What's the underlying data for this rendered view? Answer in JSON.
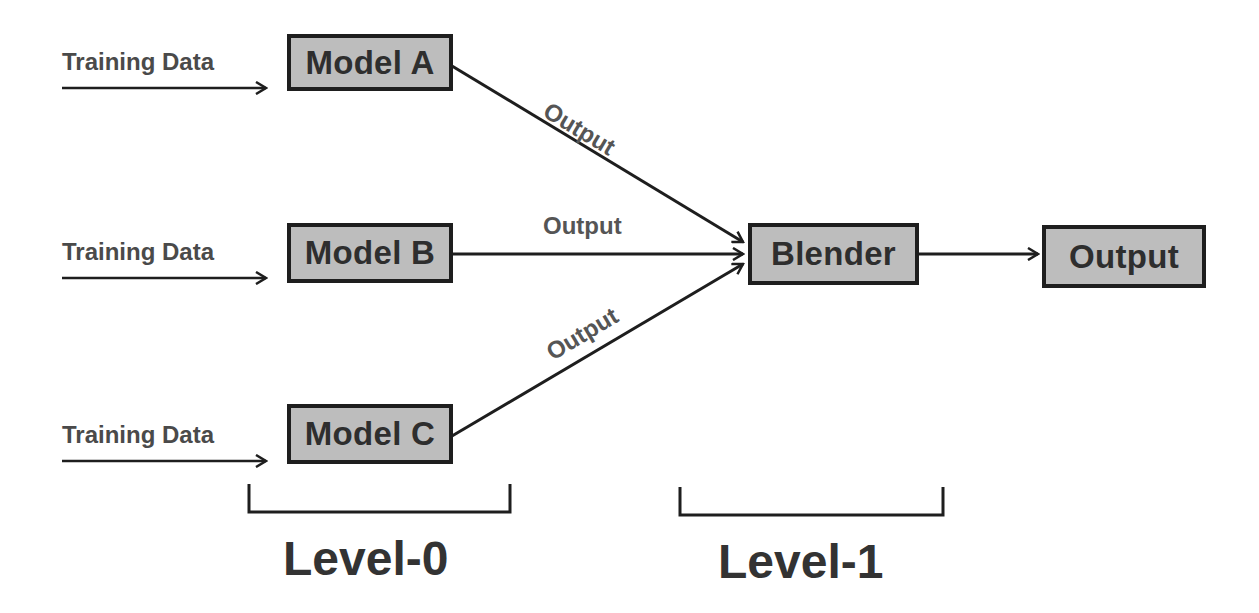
{
  "diagram": {
    "inputs": [
      {
        "label": "Training Data"
      },
      {
        "label": "Training Data"
      },
      {
        "label": "Training Data"
      }
    ],
    "models": [
      {
        "label": "Model A"
      },
      {
        "label": "Model B"
      },
      {
        "label": "Model C"
      }
    ],
    "edge_labels": [
      {
        "label": "Output"
      },
      {
        "label": "Output"
      },
      {
        "label": "Output"
      }
    ],
    "blender": {
      "label": "Blender"
    },
    "final_output": {
      "label": "Output"
    },
    "levels": [
      {
        "label": "Level-0"
      },
      {
        "label": "Level-1"
      }
    ],
    "colors": {
      "box_fill": "#bdbdbd",
      "box_border": "#1e1e1e",
      "text": "#333333",
      "line": "#1e1e1e"
    }
  }
}
